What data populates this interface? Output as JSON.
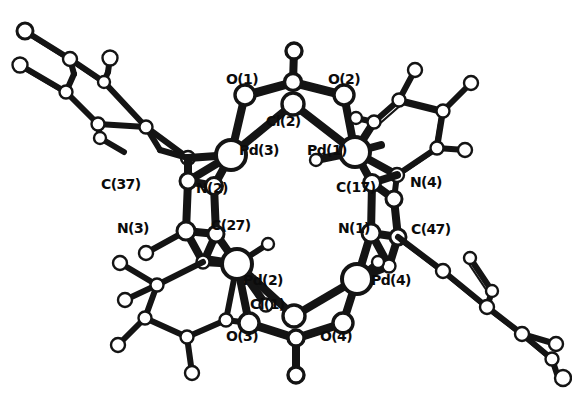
{
  "figure": {
    "kind": "crystal-structure-diagram",
    "style": "ball-and-stick",
    "background_color": "#ffffff",
    "line_color": "#141414",
    "atom_fill": "#ffffff",
    "atom_stroke": "#141414"
  },
  "labels": [
    {
      "id": "O1",
      "text": "O(1)",
      "x": 226,
      "y": 72,
      "element": "O"
    },
    {
      "id": "O2",
      "text": "O(2)",
      "x": 328,
      "y": 72,
      "element": "O"
    },
    {
      "id": "Cl2",
      "text": "Cl(2)",
      "x": 266,
      "y": 114,
      "element": "Cl"
    },
    {
      "id": "Pd3",
      "text": "Pd(3)",
      "x": 239,
      "y": 143,
      "element": "Pd"
    },
    {
      "id": "Pd1",
      "text": "Pd(1)",
      "x": 307,
      "y": 143,
      "element": "Pd"
    },
    {
      "id": "C37",
      "text": "C(37)",
      "x": 101,
      "y": 177,
      "element": "C"
    },
    {
      "id": "N2",
      "text": "N(2)",
      "x": 196,
      "y": 181,
      "element": "N"
    },
    {
      "id": "C17",
      "text": "C(17)",
      "x": 336,
      "y": 180,
      "element": "C"
    },
    {
      "id": "N4",
      "text": "N(4)",
      "x": 410,
      "y": 175,
      "element": "N"
    },
    {
      "id": "N3",
      "text": "N(3)",
      "x": 117,
      "y": 221,
      "element": "N"
    },
    {
      "id": "C27",
      "text": "C(27)",
      "x": 211,
      "y": 218,
      "element": "C"
    },
    {
      "id": "N1",
      "text": "N(1)",
      "x": 338,
      "y": 221,
      "element": "N"
    },
    {
      "id": "C47",
      "text": "C(47)",
      "x": 411,
      "y": 222,
      "element": "C"
    },
    {
      "id": "Pd2",
      "text": "Pd(2)",
      "x": 243,
      "y": 273,
      "element": "Pd"
    },
    {
      "id": "Pd4",
      "text": "Pd(4)",
      "x": 371,
      "y": 273,
      "element": "Pd"
    },
    {
      "id": "Cl1",
      "text": "Cl(1)",
      "x": 250,
      "y": 297,
      "element": "Cl"
    },
    {
      "id": "O3",
      "text": "O(3)",
      "x": 226,
      "y": 329,
      "element": "O"
    },
    {
      "id": "O4",
      "text": "O(4)",
      "x": 320,
      "y": 329,
      "element": "O"
    }
  ],
  "atoms": {
    "big": [
      {
        "id": "Pd3",
        "x": 231,
        "y": 155,
        "r": 12
      },
      {
        "id": "Pd1",
        "x": 355,
        "y": 152,
        "r": 12
      },
      {
        "id": "Pd2",
        "x": 237,
        "y": 264,
        "r": 12
      },
      {
        "id": "Pd4",
        "x": 357,
        "y": 279,
        "r": 12
      }
    ],
    "medium": [
      {
        "id": "O1",
        "x": 245,
        "y": 95
      },
      {
        "id": "O2",
        "x": 344,
        "y": 95
      },
      {
        "id": "Cl2",
        "x": 293,
        "y": 104
      },
      {
        "id": "Ctop",
        "x": 293,
        "y": 82
      },
      {
        "id": "Cl1",
        "x": 294,
        "y": 316
      },
      {
        "id": "O3",
        "x": 249,
        "y": 323
      },
      {
        "id": "O4",
        "x": 343,
        "y": 323
      },
      {
        "id": "Cbot",
        "x": 296,
        "y": 338
      },
      {
        "id": "Obot",
        "x": 296,
        "y": 375
      },
      {
        "id": "Otop",
        "x": 294,
        "y": 51
      }
    ],
    "small_note": "remaining vertices are small open circles at ring and substituent positions"
  }
}
